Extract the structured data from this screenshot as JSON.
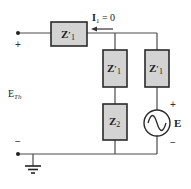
{
  "diagram": {
    "type": "circuit-schematic",
    "colors": {
      "wire": "#4a4a4a",
      "box_fill": "#d3d3d3",
      "box_stroke": "#2a2a2a",
      "text": "#222222"
    },
    "current_label": {
      "main": "I",
      "sub": "1",
      "rest": " = 0"
    },
    "components": {
      "series_top": {
        "main": "Z",
        "prime": "′",
        "sub": "1"
      },
      "branch_left_upper": {
        "main": "Z",
        "prime": "′",
        "sub": "1"
      },
      "branch_left_lower": {
        "main": "Z",
        "sub": "2"
      },
      "branch_right_upper": {
        "main": "Z",
        "prime": "′",
        "sub": "1"
      },
      "source": {
        "label": "E",
        "plus": "+",
        "minus": "−"
      }
    },
    "terminals": {
      "top_polarity": "+",
      "bottom_polarity": "−",
      "voltage_main": "E",
      "voltage_sub": "Th"
    }
  }
}
